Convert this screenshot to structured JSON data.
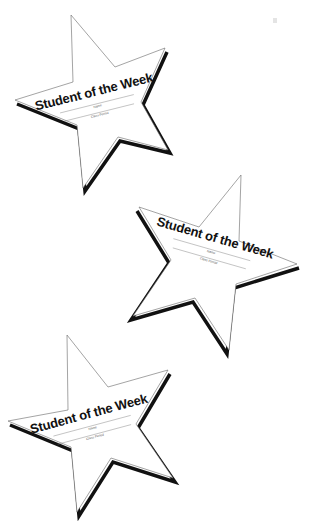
{
  "page": {
    "background": "#ffffff",
    "width": 311,
    "height": 521
  },
  "colors": {
    "outline": "#555555",
    "shadow": "#111111",
    "text": "#111111",
    "label": "#555555"
  },
  "stars": [
    {
      "id": "star-1",
      "title": "Student of the Week",
      "name_label": "Name",
      "class_label": "Class Period",
      "points": "71,15 115,67 165,48 141,102 168,150 118,137 83,188 77,125 15,100 73,82",
      "shadow": "15,100 77,125 83,188 118,137 168,150 141,102 165,48",
      "text_angle": -14,
      "text_x": 100,
      "text_y": 95
    },
    {
      "id": "star-2",
      "title": "Student of the Week",
      "name_label": "Name",
      "class_label": "Class Period",
      "points": "241,175 239,241 297,264 236,284 229,350 195,298 133,316 171,260 139,207 199,227",
      "shadow": "139,207 171,260 133,316 195,298 229,350 236,284 297,264",
      "text_angle": 16,
      "text_x": 215,
      "text_y": 240
    },
    {
      "id": "star-3",
      "title": "Student of the Week",
      "name_label": "Name",
      "class_label": "Class Period",
      "points": "67,335 108,387 168,370 136,424 173,478 111,458 77,512 71,447 8,421 68,410",
      "shadow": "8,421 71,447 77,512 111,458 173,478 136,424 168,370",
      "text_angle": -15,
      "text_x": 90,
      "text_y": 420
    }
  ]
}
